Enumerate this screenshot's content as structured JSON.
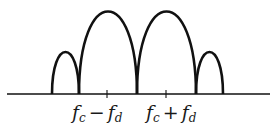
{
  "diagram": {
    "stroke_color": "#111111",
    "baseline": {
      "x1": 7,
      "x2": 270,
      "y": 94
    },
    "lobes": [
      {
        "name": "left-small",
        "x1": 52,
        "x2": 79,
        "peak_y": 50
      },
      {
        "name": "left-large",
        "x1": 79,
        "x2": 137,
        "peak_y": 8
      },
      {
        "name": "right-large",
        "x1": 137,
        "x2": 196,
        "peak_y": 8
      },
      {
        "name": "right-small",
        "x1": 196,
        "x2": 223,
        "peak_y": 50
      }
    ],
    "ticks": [
      107,
      166
    ],
    "labels": {
      "minus": {
        "base": "f",
        "sub1": "c",
        "op": "−",
        "base2": "f",
        "sub2": "d"
      },
      "plus": {
        "base": "f",
        "sub1": "c",
        "op": "+",
        "base2": "f",
        "sub2": "d"
      }
    }
  }
}
